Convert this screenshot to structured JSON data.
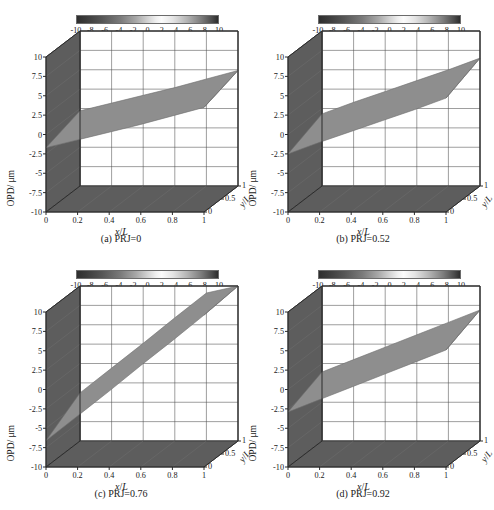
{
  "figure": {
    "ghost_header": "",
    "panels": [
      {
        "key": "a",
        "caption": "(a) PRJ=0",
        "prj": 0,
        "surface": {
          "z_at_x0": -1.0,
          "z_at_x1": 4.2,
          "tilt_y": 0.7
        }
      },
      {
        "key": "b",
        "caption": "(b) PRJ=0.52",
        "prj": 0.52,
        "surface": {
          "z_at_x0": -1.6,
          "z_at_x1": 5.6,
          "tilt_y": 0.9
        }
      },
      {
        "key": "c",
        "caption": "(c) PRJ=0.76",
        "prj": 0.76,
        "surface": {
          "z_at_x0": -5.2,
          "z_at_x1": 11.0,
          "tilt_y": 1.4
        }
      },
      {
        "key": "d",
        "caption": "(d) PRJ=0.92",
        "prj": 0.92,
        "surface": {
          "z_at_x0": -2.0,
          "z_at_x1": 6.0,
          "tilt_y": 0.9
        }
      }
    ],
    "colorbar": {
      "ticks": [
        "-10",
        "-8",
        "-6",
        "-4",
        "-2",
        "0",
        "2",
        "4",
        "6",
        "8",
        "10"
      ],
      "min": -10,
      "max": 10,
      "colormap": "gray-mirrored",
      "dark_hex": "#2e2e2e",
      "light_hex": "#fbfbfb"
    },
    "axes": {
      "z_label": "OPD/ μm",
      "z_ticks": [
        "10",
        "7.5",
        "5",
        "2.5",
        "0",
        "-2.5",
        "-5",
        "-7.5",
        "-10"
      ],
      "z_values": [
        10,
        7.5,
        5,
        2.5,
        0,
        -2.5,
        -5,
        -7.5,
        -10
      ],
      "x_label_parts": {
        "var": "x",
        "slash": "/",
        "denom": "L"
      },
      "x_ticks": [
        "0",
        "0.2",
        "0.4",
        "0.6",
        "0.8",
        "1"
      ],
      "x_values": [
        0,
        0.2,
        0.4,
        0.6,
        0.8,
        1
      ],
      "y_label_parts": {
        "var": "y",
        "slash": "/",
        "denom": "L"
      },
      "y_ticks": [
        "0",
        "0.5",
        "1"
      ],
      "y_values": [
        0,
        0.5,
        1
      ],
      "wall_hex": "#5d5d5d",
      "floor_hex": "#5d5d5d",
      "back_hex": "#ffffff",
      "grid_hex": "#4d4d4d",
      "surface_hex": "#8e8e8e"
    }
  },
  "chart_data": {
    "type": "surface",
    "xlabel": "x/L",
    "ylabel": "y/L",
    "zlabel": "OPD/ μm",
    "xlim": [
      0,
      1
    ],
    "ylim": [
      0,
      1
    ],
    "zlim": [
      -10,
      10
    ],
    "xticks": [
      0,
      0.2,
      0.4,
      0.6,
      0.8,
      1
    ],
    "yticks": [
      0,
      0.5,
      1
    ],
    "zticks": [
      -10,
      -7.5,
      -5,
      -2.5,
      0,
      2.5,
      5,
      7.5,
      10
    ],
    "grid": true,
    "colorbar": {
      "label": "",
      "range": [
        -10,
        10
      ],
      "ticks": [
        -10,
        -8,
        -6,
        -4,
        -2,
        0,
        2,
        4,
        6,
        8,
        10
      ],
      "cmap": "gray"
    },
    "panels": [
      {
        "label": "(a) PRJ=0",
        "PRJ": 0,
        "x": [
          0,
          0.2,
          0.4,
          0.6,
          0.8,
          1
        ],
        "z_mean": [
          -1.0,
          0.0,
          1.0,
          2.0,
          3.1,
          4.2
        ],
        "z_at_y0": [
          -1.7,
          -0.7,
          0.3,
          1.3,
          2.4,
          3.5
        ],
        "z_at_y1": [
          -0.3,
          0.7,
          1.7,
          2.7,
          3.8,
          4.9
        ]
      },
      {
        "label": "(b) PRJ=0.52",
        "PRJ": 0.52,
        "x": [
          0,
          0.2,
          0.4,
          0.6,
          0.8,
          1
        ],
        "z_mean": [
          -1.6,
          -0.1,
          1.3,
          2.7,
          4.1,
          5.6
        ],
        "z_at_y0": [
          -2.5,
          -1.0,
          0.4,
          1.8,
          3.2,
          4.7
        ],
        "z_at_y1": [
          -0.7,
          0.8,
          2.2,
          3.6,
          5.0,
          6.5
        ]
      },
      {
        "label": "(c) PRJ=0.76",
        "PRJ": 0.76,
        "x": [
          0,
          0.2,
          0.4,
          0.6,
          0.8,
          1
        ],
        "z_mean": [
          -5.2,
          -2.0,
          1.2,
          4.5,
          7.7,
          11.0
        ],
        "z_at_y0": [
          -6.6,
          -3.4,
          -0.2,
          3.1,
          6.3,
          9.6
        ],
        "z_at_y1": [
          -3.8,
          -0.6,
          2.6,
          5.9,
          9.1,
          12.4
        ]
      },
      {
        "label": "(d) PRJ=0.92",
        "PRJ": 0.92,
        "x": [
          0,
          0.2,
          0.4,
          0.6,
          0.8,
          1
        ],
        "z_mean": [
          -2.0,
          -0.4,
          1.2,
          2.8,
          4.4,
          6.0
        ],
        "z_at_y0": [
          -2.9,
          -1.3,
          0.3,
          1.9,
          3.5,
          5.1
        ],
        "z_at_y1": [
          -1.1,
          0.5,
          2.1,
          3.7,
          5.3,
          6.9
        ]
      }
    ]
  }
}
